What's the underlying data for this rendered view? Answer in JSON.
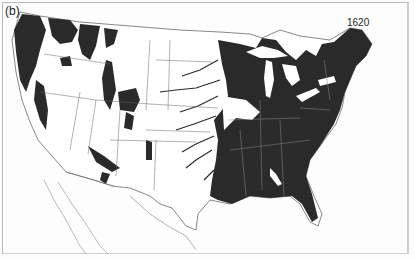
{
  "figure": {
    "panel_label": "(b)",
    "year": "1620",
    "colors": {
      "forest": "#2a2a2a",
      "land": "#ffffff",
      "borders": "#555555",
      "background": "#fdfdfd"
    }
  }
}
